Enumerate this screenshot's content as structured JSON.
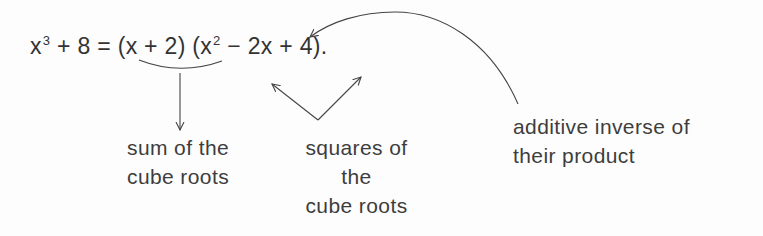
{
  "equation": {
    "lhs_base": "x",
    "lhs_exp": "3",
    "lhs_rest": " + 8 = ",
    "factor1": "(x + 2)",
    "factor2_open": " (x",
    "factor2_exp": "2",
    "factor2_rest": " − 2x + 4)."
  },
  "labels": {
    "sum": [
      "sum of the",
      "cube roots"
    ],
    "squares": [
      "squares of",
      "the",
      "cube roots"
    ],
    "inverse": [
      "additive inverse of",
      "their product"
    ]
  },
  "colors": {
    "ink": "#3a3a3a",
    "background": "#fdfdfd"
  }
}
